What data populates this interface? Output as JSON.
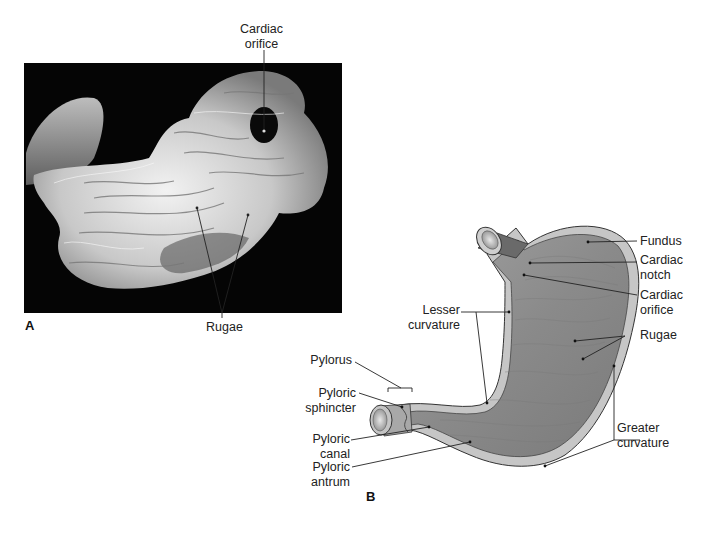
{
  "header": {
    "text": ""
  },
  "panel_a": {
    "letter": "A",
    "description": "Photograph of opened stomach showing internal mucosal folds",
    "labels": {
      "cardiac_orifice_line1": "Cardiac",
      "cardiac_orifice_line2": "orifice",
      "rugae": "Rugae"
    }
  },
  "panel_b": {
    "letter": "B",
    "description": "Diagram of stomach in frontal section",
    "labels": {
      "fundus": "Fundus",
      "cardiac_notch_line1": "Cardiac",
      "cardiac_notch_line2": "notch",
      "cardiac_orifice_line1": "Cardiac",
      "cardiac_orifice_line2": "orifice",
      "rugae": "Rugae",
      "greater_curvature_line1": "Greater",
      "greater_curvature_line2": "curvature",
      "lesser_curvature_line1": "Lesser",
      "lesser_curvature_line2": "curvature",
      "pylorus": "Pylorus",
      "pyloric_sphincter_line1": "Pyloric",
      "pyloric_sphincter_line2": "sphincter",
      "pyloric_canal_line1": "Pyloric",
      "pyloric_canal_line2": "canal",
      "pyloric_antrum_line1": "Pyloric",
      "pyloric_antrum_line2": "antrum"
    }
  },
  "colors": {
    "photo_bg": "#050505",
    "tissue_light": "#e6e6e6",
    "tissue_mid": "#a8a8a8",
    "stomach_interior": "#8e8e8e",
    "stomach_wall": "#c9c9c9",
    "stomach_outline": "#3a3a3a",
    "leader_line": "#222222"
  }
}
